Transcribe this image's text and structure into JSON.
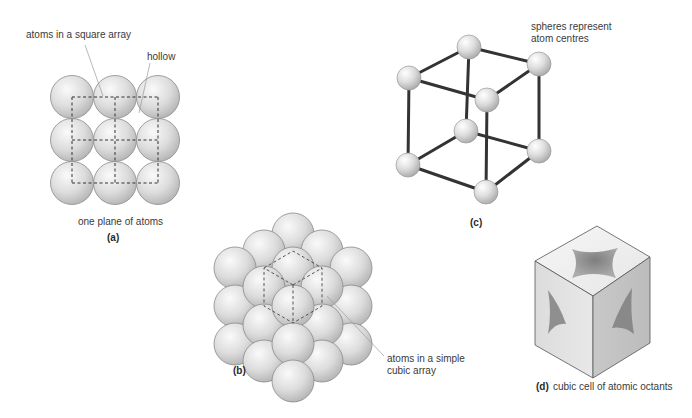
{
  "panel_a": {
    "label": "(a)",
    "caption": "one plane of atoms",
    "annotations": {
      "square_array": "atoms in a square array",
      "hollow": "hollow"
    },
    "grid": {
      "rows": 3,
      "cols": 3
    }
  },
  "panel_b": {
    "label": "(b)",
    "annotation_line1": "atoms in a simple",
    "annotation_line2": "cubic array"
  },
  "panel_c": {
    "label": "(c)",
    "annotation_line1": "spheres represent",
    "annotation_line2": "atom centres"
  },
  "panel_d": {
    "label": "(d)",
    "caption": "cubic cell of atomic octants"
  },
  "colors": {
    "sphere_light": "#f4f4f4",
    "sphere_dark": "#b8b8b8",
    "edge": "#3a3a3a",
    "leader": "#9a9a9a"
  }
}
